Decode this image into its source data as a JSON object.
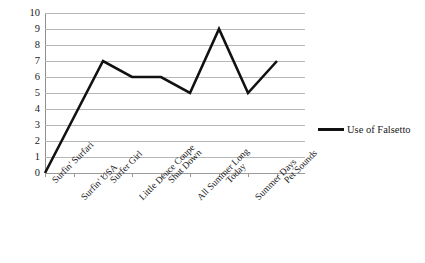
{
  "chart_data": {
    "type": "line",
    "title": "",
    "xlabel": "",
    "ylabel": "",
    "ylim": [
      0,
      10
    ],
    "ytick_step": 1,
    "yticks": [
      "10",
      "9",
      "8",
      "7",
      "6",
      "5",
      "4",
      "3",
      "2",
      "1",
      "0"
    ],
    "grid": true,
    "legend_position": "right",
    "categories": [
      "Surfin' Surfari",
      "Surfin' USA",
      "Surfer Girl",
      "Little Deuce Coupe",
      "Shut Down",
      "All Summer Long",
      "Today",
      "Summer Days",
      "Pet Sounds"
    ],
    "series": [
      {
        "name": "Use of Falsetto",
        "color": "#111111",
        "values": [
          0,
          3.5,
          7,
          6,
          6,
          5,
          9,
          5,
          7
        ]
      }
    ]
  },
  "legend": {
    "entries": [
      {
        "label": "Use of Falsetto",
        "swatch": "line-swatch"
      }
    ]
  },
  "colors": {
    "series_line": "#111111",
    "gridline": "#b7b7b7",
    "axis": "#8f8f8f",
    "text": "#1a1a1a",
    "background": "#ffffff"
  }
}
